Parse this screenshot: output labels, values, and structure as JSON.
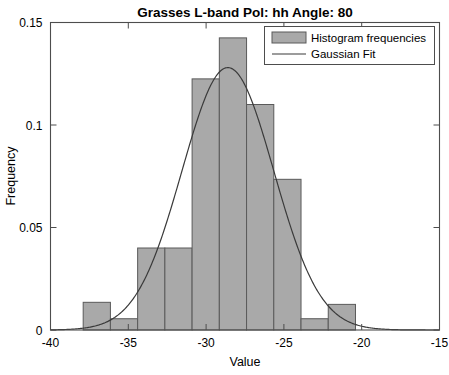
{
  "chart_data": {
    "type": "bar",
    "title": "Grasses   L-band   Pol: hh   Angle: 80",
    "xlabel": "Value",
    "ylabel": "Frequency",
    "xlim": [
      -40,
      -15
    ],
    "ylim": [
      0,
      0.15
    ],
    "xticks": [
      -40,
      -35,
      -30,
      -25,
      -20,
      -15
    ],
    "xticklabels": [
      "-40",
      "-35",
      "-30",
      "-25",
      "-20",
      "-15"
    ],
    "yticks": [
      0,
      0.05,
      0.1,
      0.15
    ],
    "yticklabels": [
      "0",
      "0.05",
      "0.1",
      "0.15"
    ],
    "grid": false,
    "bin_width": 1.75,
    "bin_edges": [
      -37.9,
      -36.15,
      -34.4,
      -32.65,
      -30.9,
      -29.15,
      -27.4,
      -25.65,
      -23.9,
      -22.15,
      -20.4
    ],
    "categories": [
      "-37.0",
      "-35.3",
      "-33.5",
      "-31.8",
      "-30.0",
      "-28.3",
      "-26.5",
      "-24.8",
      "-23.0",
      "-21.3"
    ],
    "values": [
      0.0135,
      0.0055,
      0.04,
      0.04,
      0.1225,
      0.1425,
      0.11,
      0.0735,
      0.0055,
      0.0125
    ],
    "series": [
      {
        "name": "Histogram frequencies",
        "type": "bar",
        "values": [
          0.0135,
          0.0055,
          0.04,
          0.04,
          0.1225,
          0.1425,
          0.11,
          0.0735,
          0.0055,
          0.0125
        ]
      },
      {
        "name": "Gaussian Fit",
        "type": "line",
        "mean": -28.6,
        "sigma": 2.95,
        "peak": 0.128
      }
    ],
    "legend": {
      "position": "top-right",
      "entries": [
        {
          "label": "Histogram frequencies",
          "marker": "filled-box",
          "color": "#a9a9a9"
        },
        {
          "label": "Gaussian Fit",
          "marker": "line",
          "color": "#3a3a3a"
        }
      ]
    },
    "colors": {
      "bar_fill": "#a9a9a9",
      "bar_edge": "#5a5a5a",
      "fit_line": "#3a3a3a",
      "axis": "#4d4d4d",
      "background": "#ffffff"
    }
  }
}
